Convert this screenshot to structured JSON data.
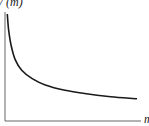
{
  "chart_data": {
    "type": "line",
    "title": "",
    "xlabel": "m",
    "ylabel": "V (m)",
    "grid": false,
    "legend": null,
    "x_ticks": [],
    "y_ticks": [],
    "series": [
      {
        "name": "V(m)",
        "points_normalized": [
          [
            0.01,
            1.0
          ],
          [
            0.02,
            0.85
          ],
          [
            0.04,
            0.7
          ],
          [
            0.07,
            0.57
          ],
          [
            0.12,
            0.47
          ],
          [
            0.2,
            0.39
          ],
          [
            0.3,
            0.33
          ],
          [
            0.45,
            0.28
          ],
          [
            0.6,
            0.25
          ],
          [
            0.8,
            0.22
          ],
          [
            1.0,
            0.2
          ]
        ]
      }
    ]
  },
  "axes": {
    "ylabel": "V (m)",
    "xlabel": "m"
  },
  "colors": {
    "curve": "#1a1a1a",
    "axis": "#555555"
  }
}
